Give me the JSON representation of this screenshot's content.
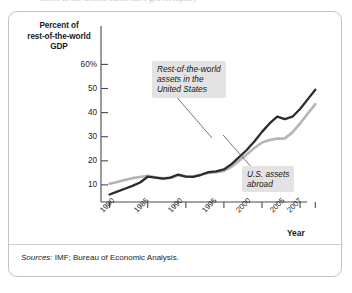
{
  "card": {
    "ghost_top_text": "assets in the United States have grown rapidly",
    "source_prefix": "Sources:",
    "source_text": "IMF; Bureau of Economic Analysis."
  },
  "axis": {
    "y_title_lines": [
      "Percent of",
      "rest-of-the-world",
      "GDP"
    ],
    "y_title": "Percent of rest-of-the-world GDP",
    "x_title": "Year",
    "y_ticks": [
      "60%",
      "50",
      "40",
      "30",
      "20",
      "10"
    ],
    "x_ticks": [
      "1980",
      "1985",
      "1990",
      "1995",
      "2000",
      "2005",
      "2007"
    ]
  },
  "annotations": [
    {
      "id": "rest-of-world",
      "lines": [
        "Rest-of-the-world",
        "assets in the",
        "United States"
      ]
    },
    {
      "id": "us-abroad",
      "lines": [
        "U.S. assets",
        "abroad"
      ]
    }
  ],
  "colors": {
    "rest_of_world_line": "#2b2b2b",
    "us_abroad_line": "#b4b4b4",
    "axis": "#4a4a4a",
    "callout_bg": "#e3e3e3",
    "card_border": "#c3c3c3"
  },
  "chart_data": {
    "type": "line",
    "title": "Percent of rest-of-the-world GDP",
    "xlabel": "Year",
    "ylabel": "Percent of rest-of-the-world GDP",
    "xlim": [
      1980,
      2007
    ],
    "ylim": [
      0,
      62
    ],
    "ytick_values": [
      10,
      20,
      30,
      40,
      50,
      60
    ],
    "xtick_values": [
      1980,
      1985,
      1990,
      1995,
      2000,
      2005,
      2007
    ],
    "grid": false,
    "legend": "annotations-inline",
    "x": [
      1980,
      1981,
      1982,
      1983,
      1984,
      1985,
      1986,
      1987,
      1988,
      1989,
      1990,
      1991,
      1992,
      1993,
      1994,
      1995,
      1996,
      1997,
      1998,
      1999,
      2000,
      2001,
      2002,
      2003,
      2004,
      2005,
      2006,
      2007
    ],
    "series": [
      {
        "name": "Rest-of-the-world assets in the United States",
        "color": "#2b2b2b",
        "values": [
          6.0,
          7.2,
          8.4,
          9.6,
          11.0,
          13.4,
          13.0,
          12.6,
          13.0,
          14.3,
          13.4,
          13.3,
          14.2,
          15.3,
          15.6,
          16.4,
          18.6,
          21.5,
          24.5,
          28.0,
          32.0,
          35.5,
          38.3,
          37.3,
          38.3,
          41.5,
          45.5,
          49.5
        ]
      },
      {
        "name": "U.S. assets abroad",
        "color": "#b4b4b4",
        "values": [
          10.5,
          11.2,
          12.0,
          12.8,
          13.3,
          13.8,
          13.2,
          12.7,
          13.0,
          14.0,
          13.6,
          13.6,
          14.2,
          15.0,
          15.3,
          15.8,
          17.5,
          20.0,
          22.6,
          25.3,
          27.6,
          28.6,
          29.2,
          29.3,
          31.8,
          35.5,
          39.5,
          43.5
        ]
      }
    ]
  }
}
